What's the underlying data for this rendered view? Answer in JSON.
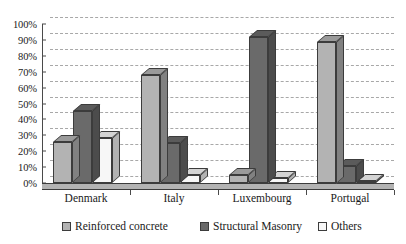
{
  "chart_data": {
    "type": "bar",
    "title": "",
    "subtitle": "",
    "xlabel": "",
    "ylabel": "",
    "categories": [
      "Denmark",
      "Italy",
      "Luxembourg",
      "Portugal"
    ],
    "series": [
      {
        "name": "Reinforced concrete",
        "color": "#b3b3b3",
        "values": [
          26,
          68,
          5,
          89
        ]
      },
      {
        "name": "Structural Masonry",
        "color": "#6a6a6a",
        "values": [
          45,
          25,
          92,
          11
        ]
      },
      {
        "name": "Others",
        "color": "#f7f7f7",
        "values": [
          28,
          5,
          3,
          1
        ]
      }
    ],
    "ylim": [
      0,
      100
    ],
    "ytick_values": [
      0,
      10,
      20,
      30,
      40,
      50,
      60,
      70,
      80,
      90,
      100
    ],
    "ytick_labels": [
      "0%",
      "10%",
      "20%",
      "30%",
      "40%",
      "50%",
      "60%",
      "70%",
      "80%",
      "90%",
      "100%"
    ],
    "grid": true,
    "grid_style": "dashed",
    "legend_position": "bottom",
    "value_format": "percent",
    "three_d": true
  },
  "axis": {
    "line_color": "#4a4a4a",
    "grid_color": "#9a9a9a"
  },
  "legend": {
    "items": [
      {
        "label": "Reinforced concrete",
        "color": "#b3b3b3"
      },
      {
        "label": "Structural Masonry",
        "color": "#6a6a6a"
      },
      {
        "label": "Others",
        "color": "#f7f7f7"
      }
    ]
  }
}
